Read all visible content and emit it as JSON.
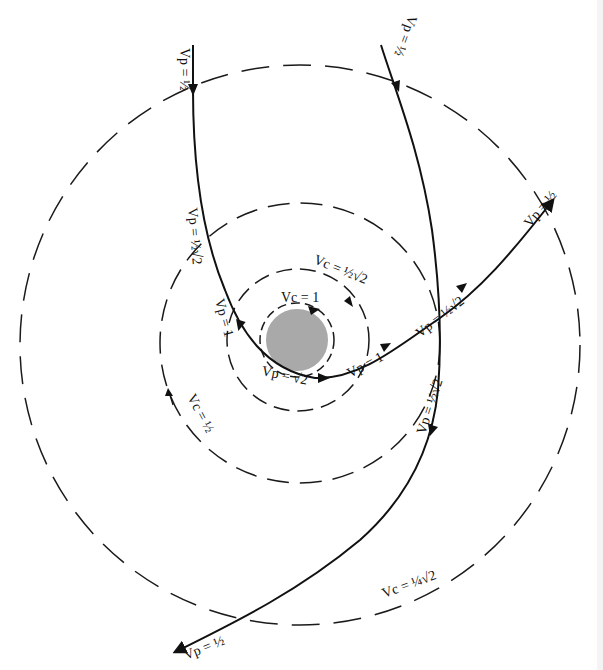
{
  "figure": {
    "planet": {
      "color": "#a9a9a9",
      "edge_color": "#ffffff"
    },
    "circular_orbits": [
      {
        "name": "inner",
        "label": "Vc = 1"
      },
      {
        "name": "second",
        "label": "Vc = ½√2"
      },
      {
        "name": "third",
        "label": "Vc = ½"
      },
      {
        "name": "outer",
        "label": "Vc = ¼√2"
      }
    ],
    "trajectories": [
      {
        "name": "parabolic-incoming",
        "labels": [
          "Vp = ½",
          "Vp = ½√2",
          "Vp = 1",
          "Vp = √2"
        ]
      },
      {
        "name": "parabolic-outgoing",
        "labels": [
          "Vp = 1",
          "Vp = ½√2",
          "Vp = ½"
        ]
      },
      {
        "name": "second-hyperbola-incoming",
        "labels": [
          "Vp = ½"
        ]
      },
      {
        "name": "second-hyperbola-outgoing",
        "labels": [
          "Vp = ½√2",
          "Vp = ½"
        ]
      }
    ],
    "labels": {
      "vp_half_top_left": "Vp = ½",
      "vp_half_top_right": "Vp = ½",
      "vp_half_sqrt2_left": "Vp = ½√2",
      "vp_1_left": "Vp = 1",
      "vp_sqrt2_bottom": "Vp = √2",
      "vp_1_right": "Vp = 1",
      "vp_half_sqrt2_right": "Vp = ½√2",
      "vp_half_right_arrow": "Vp = ½",
      "vp_half_sqrt2_lower_right": "Vp = ½√2",
      "vp_half_bottom_left": "Vp = ½",
      "vc_1": "Vc = 1",
      "vc_half_sqrt2": "Vc = ½√2",
      "vc_half": "Vc = ½",
      "vc_quarter_sqrt2": "Vc = ¼√2"
    }
  }
}
